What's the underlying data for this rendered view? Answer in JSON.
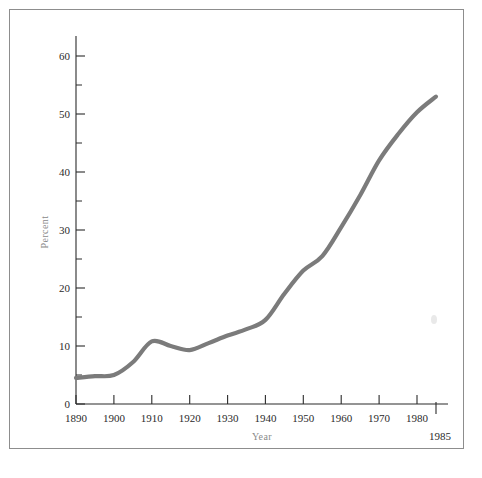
{
  "figure": {
    "background_color": "#ffffff",
    "frame_color": "#8d8d8d",
    "line_color": "#7b7b7b",
    "axis_color": "#2b2b2b",
    "axis_title_color": "#8a8a8a"
  },
  "chart_data": {
    "type": "line",
    "title": "",
    "subtitle": "",
    "xlabel": "Year",
    "ylabel": "Percent",
    "xlim": [
      1890,
      1987
    ],
    "ylim": [
      0,
      63
    ],
    "grid": false,
    "legend": "none",
    "x_tick_labels": [
      "1890",
      "1900",
      "1910",
      "1920",
      "1930",
      "1940",
      "1950",
      "1960",
      "1970",
      "1980"
    ],
    "x_ticks": [
      1890,
      1900,
      1910,
      1920,
      1930,
      1940,
      1950,
      1960,
      1970,
      1980
    ],
    "x_extra_tick": 1985,
    "x_extra_tick_label": "1985",
    "y_ticks_major": [
      0,
      10,
      20,
      30,
      40,
      50,
      60
    ],
    "y_tick_labels": [
      "0",
      "10",
      "20",
      "30",
      "40",
      "50",
      "60"
    ],
    "y_ticks_minor": [
      5,
      15,
      25,
      35,
      45,
      55
    ],
    "series": [
      {
        "name": "Percent",
        "color": "#7b7b7b",
        "x": [
          1890,
          1895,
          1900,
          1905,
          1910,
          1915,
          1920,
          1925,
          1930,
          1935,
          1940,
          1945,
          1950,
          1955,
          1960,
          1965,
          1970,
          1975,
          1980,
          1985
        ],
        "values": [
          4.5,
          4.8,
          5.0,
          7.2,
          10.8,
          10.0,
          9.3,
          10.5,
          11.8,
          12.9,
          14.5,
          19.0,
          23.0,
          25.5,
          30.5,
          36.0,
          42.0,
          46.5,
          50.3,
          53.0
        ]
      }
    ]
  },
  "axes": {
    "y_axis_label": "Percent",
    "x_axis_label": "Year"
  }
}
